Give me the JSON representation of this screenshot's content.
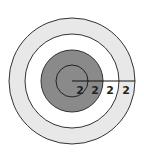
{
  "diagram": {
    "type": "concentric-circles",
    "center": [
      72,
      81
    ],
    "rings": [
      {
        "name": "outer-ring",
        "radius": 63,
        "fill": "#e8e8e8"
      },
      {
        "name": "second-ring",
        "radius": 47,
        "fill": "#ffffff"
      },
      {
        "name": "third-ring",
        "radius": 31,
        "fill": "#8a8a8a"
      },
      {
        "name": "inner-circle",
        "radius": 16,
        "fill": "#8a8a8a"
      }
    ],
    "radius_line": {
      "from": [
        72,
        81
      ],
      "to": [
        135,
        81
      ]
    },
    "labels": [
      "2",
      "2",
      "2",
      "2"
    ],
    "stroke": "#333333"
  }
}
